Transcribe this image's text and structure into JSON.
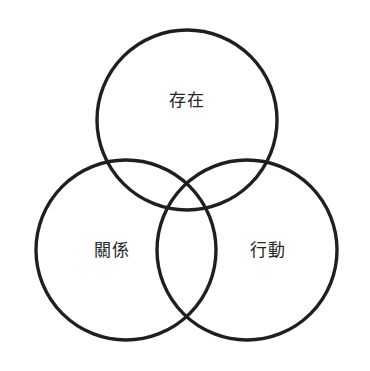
{
  "diagram": {
    "type": "venn",
    "set_count": 3,
    "background_color": "#ffffff",
    "stroke_color": "#1f1f1f",
    "text_color": "#262626",
    "circles": [
      {
        "id": "being",
        "label": "存在",
        "cx": 187,
        "cy": 120,
        "r": 90,
        "label_x": 187,
        "label_y": 100
      },
      {
        "id": "relation",
        "label": "關係",
        "cx": 126,
        "cy": 250,
        "r": 90,
        "label_x": 112,
        "label_y": 250
      },
      {
        "id": "action",
        "label": "行動",
        "cx": 247,
        "cy": 250,
        "r": 90,
        "label_x": 268,
        "label_y": 250
      }
    ],
    "labels": {
      "being": "存在",
      "relation": "關係",
      "action": "行動"
    }
  }
}
